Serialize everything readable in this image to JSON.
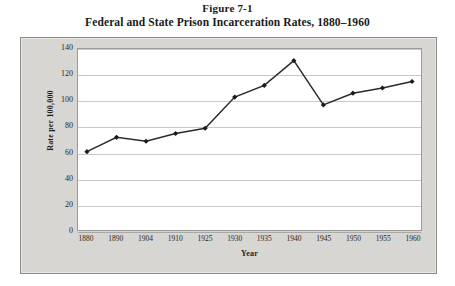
{
  "figure": {
    "number": "Figure 7-1",
    "caption": "Federal and State Prison Incarceration Rates, 1880–1960"
  },
  "chart_data": {
    "type": "line",
    "title": "Federal and State Prison Incarceration Rates, 1880–1960",
    "xlabel": "Year",
    "ylabel": "Rate per 100,000",
    "categories": [
      "1880",
      "1890",
      "1904",
      "1910",
      "1925",
      "1930",
      "1935",
      "1940",
      "1945",
      "1950",
      "1955",
      "1960"
    ],
    "values": [
      61,
      72,
      69,
      75,
      79,
      103,
      112,
      131,
      97,
      106,
      110,
      115
    ],
    "ylim": [
      0,
      140
    ],
    "yticks": [
      "140",
      "120",
      "100",
      "80",
      "60",
      "40",
      "20",
      "0"
    ],
    "ytick_values": [
      140,
      120,
      100,
      80,
      60,
      40,
      20,
      0
    ],
    "grid": "horizontal",
    "legend": "none",
    "marker": "diamond",
    "line_color": "#2b2b2b",
    "marker_color": "#1a1a1a",
    "gridline_color": "#c9c9c9",
    "plot_background": "#ffffff",
    "frame_background": "#d7d6d2"
  }
}
